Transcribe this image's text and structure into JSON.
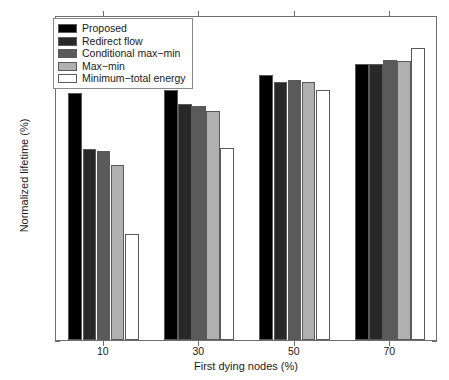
{
  "chart_data": {
    "type": "bar",
    "title": "",
    "xlabel": "First dying nodes (%)",
    "ylabel": "Normalized lifetime (%)",
    "categories": [
      "10",
      "30",
      "50",
      "70"
    ],
    "ylim": [
      0,
      100
    ],
    "yticks": [
      0,
      10,
      20,
      30,
      40,
      50,
      60,
      70,
      80,
      90,
      100
    ],
    "xticklabels": [
      "10",
      "30",
      "50",
      "70"
    ],
    "grid": false,
    "legend_position": "upper-left-inside",
    "series": [
      {
        "name": "Proposed",
        "color": "#000000",
        "values": [
          76.0,
          77.0,
          81.5,
          85.0
        ]
      },
      {
        "name": "Redirect flow",
        "color": "#282828",
        "values": [
          58.8,
          72.5,
          79.5,
          84.8
        ]
      },
      {
        "name": "Conditional max-min",
        "color": "#5a5a5a",
        "values": [
          58.2,
          72.0,
          80.0,
          86.3
        ]
      },
      {
        "name": "Max-min",
        "color": "#b0b0b0",
        "values": [
          54.0,
          70.5,
          79.3,
          85.7
        ]
      },
      {
        "name": "Minimum-total energy",
        "color": "#ffffff",
        "values": [
          32.5,
          59.0,
          77.0,
          90.0
        ]
      }
    ]
  },
  "legend": {
    "items": [
      {
        "label": "Proposed"
      },
      {
        "label": "Redirect flow"
      },
      {
        "label": "Conditional max−min"
      },
      {
        "label": "Max−min"
      },
      {
        "label": "Minimum−total energy"
      }
    ]
  },
  "axes": {
    "ytick_labels": [
      "100",
      "90",
      "80",
      "70",
      "60",
      "50",
      "40",
      "30",
      "20",
      "10",
      "0"
    ],
    "xtick_labels": [
      "10",
      "30",
      "50",
      "70"
    ],
    "xlabel": "First dying nodes (%)",
    "ylabel": "Normalized lifetime (%)"
  }
}
